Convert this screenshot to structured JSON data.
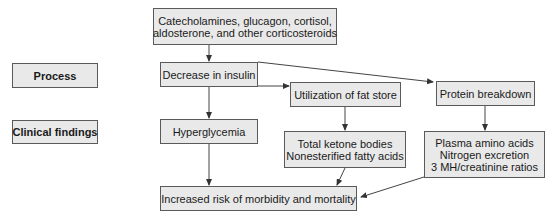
{
  "labels": {
    "process": "Process",
    "clinical_findings": "Clinical findings"
  },
  "nodes": {
    "hormones": {
      "line1": "Catecholamines, glucagon, cortisol,",
      "line2": "aldosterone, and other corticosteroids"
    },
    "decrease_insulin": "Decrease in insulin",
    "fat_store": "Utilization of fat store",
    "protein_breakdown": "Protein breakdown",
    "hyperglycemia": "Hyperglycemia",
    "ketone": {
      "line1": "Total ketone bodies",
      "line2": "Nonesterified fatty acids"
    },
    "plasma": {
      "line1": "Plasma amino acids",
      "line2": "Nitrogen excretion",
      "line3": "3 MH/creatinine ratios"
    },
    "outcome": "Increased risk of morbidity and mortality"
  },
  "colors": {
    "box_fill": "#e9e9e9",
    "box_border": "#5a5a5a",
    "arrow": "#333333"
  }
}
